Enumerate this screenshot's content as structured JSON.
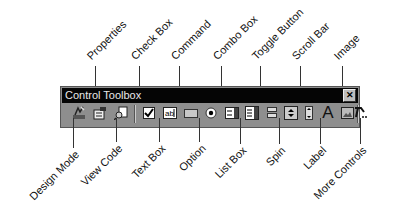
{
  "window": {
    "title": "Control Toolbox",
    "close_label": "×"
  },
  "top_labels": [
    {
      "name": "properties",
      "text": "Properties"
    },
    {
      "name": "check-box",
      "text": "Check Box"
    },
    {
      "name": "command",
      "text": "Command"
    },
    {
      "name": "combo-box",
      "text": "Combo Box"
    },
    {
      "name": "toggle-button",
      "text": "Toggle Button"
    },
    {
      "name": "scroll-bar",
      "text": "Scroll Bar"
    },
    {
      "name": "image",
      "text": "Image"
    }
  ],
  "bottom_labels": [
    {
      "name": "design-mode",
      "text": "Design Mode"
    },
    {
      "name": "view-code",
      "text": "View Code"
    },
    {
      "name": "text-box",
      "text": "Text Box"
    },
    {
      "name": "option",
      "text": "Option"
    },
    {
      "name": "list-box",
      "text": "List Box"
    },
    {
      "name": "spin",
      "text": "Spin"
    },
    {
      "name": "label",
      "text": "Label"
    },
    {
      "name": "more-controls",
      "text": "More Controls"
    }
  ],
  "tools": [
    {
      "name": "design-mode",
      "icon": "design-mode-icon"
    },
    {
      "name": "properties",
      "icon": "properties-icon"
    },
    {
      "name": "view-code",
      "icon": "view-code-icon"
    },
    {
      "name": "check-box",
      "icon": "check-box-icon"
    },
    {
      "name": "text-box",
      "icon": "text-box-icon"
    },
    {
      "name": "command",
      "icon": "command-button-icon"
    },
    {
      "name": "option",
      "icon": "option-button-icon"
    },
    {
      "name": "combo-box",
      "icon": "combo-box-icon"
    },
    {
      "name": "list-box",
      "icon": "list-box-icon"
    },
    {
      "name": "toggle-button",
      "icon": "toggle-button-icon"
    },
    {
      "name": "spin",
      "icon": "spin-button-icon"
    },
    {
      "name": "scroll-bar",
      "icon": "scroll-bar-icon"
    },
    {
      "name": "label",
      "icon": "label-icon",
      "glyph": "A"
    },
    {
      "name": "image",
      "icon": "image-icon"
    },
    {
      "name": "more-controls",
      "icon": "more-controls-icon"
    }
  ],
  "icon_glyphs": {
    "text_box": "ab|",
    "label": "A"
  }
}
